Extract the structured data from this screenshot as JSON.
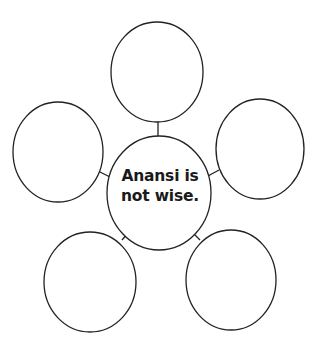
{
  "diagram": {
    "type": "web-organizer",
    "center": {
      "line1": "Anansi is",
      "line2": "not wise."
    },
    "outer_nodes": [
      {
        "position": "top",
        "text": ""
      },
      {
        "position": "left",
        "text": ""
      },
      {
        "position": "right",
        "text": ""
      },
      {
        "position": "bottom-left",
        "text": ""
      },
      {
        "position": "bottom-right",
        "text": ""
      }
    ],
    "colors": {
      "stroke": "#222222",
      "background": "#ffffff",
      "text": "#1a1a1a"
    }
  }
}
